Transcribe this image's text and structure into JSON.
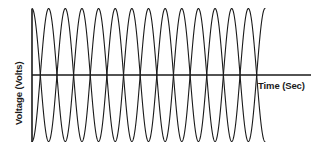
{
  "figure": {
    "background_color": "#ffffff",
    "line_color": "#1a1a1a"
  },
  "axes": {
    "y_axis_label": "Voltage (Volts)",
    "x_axis_label": "Time (Sec)",
    "origin_x_px": 32,
    "zero_line_y_px": 75,
    "x_axis_end_px": 311,
    "y_axis_top_px": 9,
    "y_axis_bottom_px": 142
  },
  "chart_data": {
    "type": "line",
    "title": "",
    "xlabel": "Time (Sec)",
    "ylabel": "Voltage (Volts)",
    "grid": false,
    "legend": "none",
    "xlim": [
      0,
      7.2
    ],
    "ylim": [
      -1.1,
      1.1
    ],
    "x_tick_labels": [],
    "y_tick_labels": [],
    "cycles_shown": 7,
    "amplitude": 1.0,
    "period": 1.0,
    "series": [
      {
        "name": "Waveform A",
        "phase_deg": 90,
        "amplitude": 1.0,
        "cycles": 7,
        "description": "Sine wave starting at positive peak, descending"
      },
      {
        "name": "Waveform B",
        "phase_deg": -90,
        "amplitude": 1.0,
        "cycles": 7,
        "description": "Sine wave starting at negative peak, ascending; 180 degrees out of phase with Waveform A"
      }
    ],
    "annotation": "Two overlapping out-of-phase sinusoidal voltage waveforms plotted against time"
  }
}
